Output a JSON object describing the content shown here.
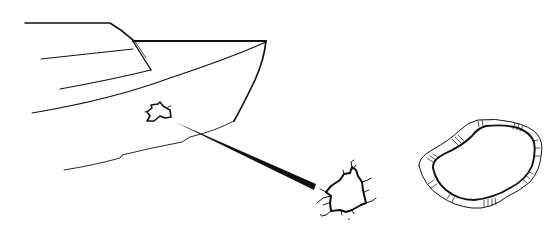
{
  "figure": {
    "colors": {
      "ink": "#111111",
      "background": "#ffffff"
    },
    "elements": [
      {
        "id": "boat-bow",
        "label": "Boat bow (hull and cabin)"
      },
      {
        "id": "hull-hole",
        "label": "Small hole in hull"
      },
      {
        "id": "pointer-line",
        "label": "Pointer line to detail"
      },
      {
        "id": "hole-detail",
        "label": "Enlarged jagged hole"
      },
      {
        "id": "patch-ring",
        "label": "Ring-shaped patch"
      }
    ]
  }
}
